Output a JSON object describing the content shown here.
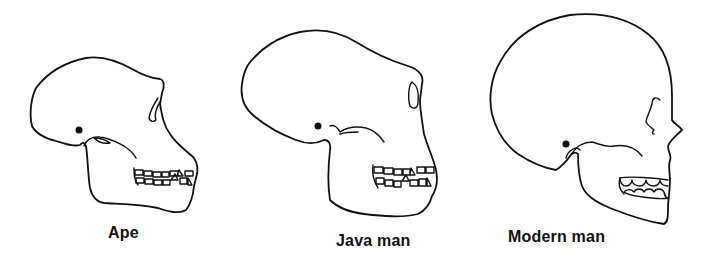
{
  "figure": {
    "panels": [
      {
        "id": "ape",
        "label": "Ape"
      },
      {
        "id": "java-man",
        "label": "Java man"
      },
      {
        "id": "modern-man",
        "label": "Modern man"
      }
    ]
  }
}
